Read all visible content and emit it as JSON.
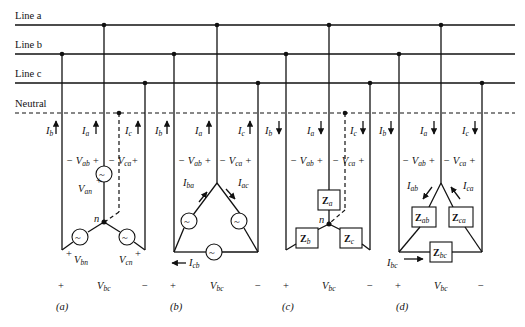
{
  "figure": {
    "bus_lines": [
      {
        "id": "a",
        "label": "Line a",
        "y": 25,
        "style": "solid"
      },
      {
        "id": "b",
        "label": "Line b",
        "y": 54,
        "style": "solid"
      },
      {
        "id": "c",
        "label": "Line c",
        "y": 83,
        "style": "solid"
      },
      {
        "id": "n",
        "label": "Neutral",
        "y": 113,
        "style": "dashed"
      }
    ],
    "panels": [
      {
        "caption": "(a)",
        "type": "Y-connected source",
        "currents": {
          "b": "I",
          "b_sub": "b",
          "a": "I",
          "a_sub": "a",
          "c": "I",
          "c_sub": "c",
          "direction": "up"
        },
        "voltages": {
          "ab_minus": "−",
          "ab": "V",
          "ab_sub": "ab",
          "ab_plus": "+",
          "ca_minus": "−",
          "ca": "V",
          "ca_sub": "ca",
          "ca_plus": "+"
        },
        "phase_voltages": [
          {
            "name": "V",
            "sub": "an",
            "sign": "+"
          },
          {
            "name": "V",
            "sub": "bn",
            "sign": "+"
          },
          {
            "name": "V",
            "sub": "cn",
            "sign": "+"
          }
        ],
        "node": "n",
        "bottom": {
          "plus": "+",
          "v": "V",
          "v_sub": "bc",
          "minus": "−"
        }
      },
      {
        "caption": "(b)",
        "type": "Δ-connected source",
        "currents": {
          "b": "I",
          "b_sub": "b",
          "a": "I",
          "a_sub": "a",
          "c": "I",
          "c_sub": "c",
          "direction": "up"
        },
        "voltages": {
          "ab_minus": "−",
          "ab": "V",
          "ab_sub": "ab",
          "ab_plus": "+",
          "ca_minus": "−",
          "ca": "V",
          "ca_sub": "ca",
          "ca_plus": "+"
        },
        "phase_currents": [
          {
            "name": "I",
            "sub": "ba"
          },
          {
            "name": "I",
            "sub": "ac"
          },
          {
            "name": "I",
            "sub": "cb"
          }
        ],
        "bottom": {
          "plus": "+",
          "v": "V",
          "v_sub": "bc",
          "minus": "−"
        }
      },
      {
        "caption": "(c)",
        "type": "Y-connected load",
        "currents": {
          "b": "I",
          "b_sub": "b",
          "a": "I",
          "a_sub": "a",
          "c": "I",
          "c_sub": "c",
          "direction": "down"
        },
        "voltages": {
          "ab_minus": "−",
          "ab": "V",
          "ab_sub": "ab",
          "ab_plus": "+",
          "ca_minus": "−",
          "ca": "V",
          "ca_sub": "ca",
          "ca_plus": "+"
        },
        "impedances": [
          {
            "name": "Z",
            "sub": "a"
          },
          {
            "name": "Z",
            "sub": "b"
          },
          {
            "name": "Z",
            "sub": "c"
          }
        ],
        "node": "n",
        "bottom": {
          "plus": "+",
          "v": "V",
          "v_sub": "bc",
          "minus": "−"
        }
      },
      {
        "caption": "(d)",
        "type": "Δ-connected load",
        "currents": {
          "b": "I",
          "b_sub": "b",
          "a": "I",
          "a_sub": "a",
          "c": "I",
          "c_sub": "c",
          "direction": "down"
        },
        "voltages": {
          "ab_minus": "−",
          "ab": "V",
          "ab_sub": "ab",
          "ab_plus": "+",
          "ca_minus": "−",
          "ca": "V",
          "ca_sub": "ca",
          "ca_plus": "+"
        },
        "impedances": [
          {
            "name": "Z",
            "sub": "ab"
          },
          {
            "name": "Z",
            "sub": "ca"
          },
          {
            "name": "Z",
            "sub": "bc"
          }
        ],
        "phase_currents": [
          {
            "name": "I",
            "sub": "ab"
          },
          {
            "name": "I",
            "sub": "ca"
          },
          {
            "name": "I",
            "sub": "bc"
          }
        ],
        "bottom": {
          "plus": "+",
          "v": "V",
          "v_sub": "bc",
          "minus": "−"
        }
      }
    ],
    "source_symbol": "~"
  }
}
